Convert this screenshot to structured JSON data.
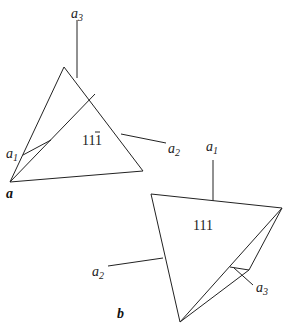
{
  "figure": {
    "panel_a": {
      "label": "a",
      "face_label": "11",
      "face_label_bar": "1",
      "axes": [
        {
          "name": "a",
          "sub": "3"
        },
        {
          "name": "a",
          "sub": "1"
        },
        {
          "name": "a",
          "sub": "2"
        }
      ]
    },
    "panel_b": {
      "label": "b",
      "face_label": "111",
      "axes": [
        {
          "name": "a",
          "sub": "1"
        },
        {
          "name": "a",
          "sub": "2"
        },
        {
          "name": "a",
          "sub": "3"
        }
      ]
    }
  }
}
